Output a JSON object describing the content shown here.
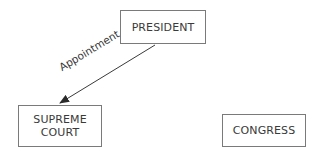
{
  "diagram": {
    "nodes": [
      {
        "id": "president",
        "label": "PRESIDENT"
      },
      {
        "id": "supreme_court",
        "label": "SUPREME\nCOURT"
      },
      {
        "id": "congress",
        "label": "CONGRESS"
      }
    ],
    "edges": [
      {
        "from": "president",
        "to": "supreme_court",
        "label": "Appointment"
      }
    ],
    "colors": {
      "border": "#7a7a7a",
      "text": "#3a3a3a",
      "arrow": "#3a3a3a",
      "background": "#ffffff"
    }
  }
}
